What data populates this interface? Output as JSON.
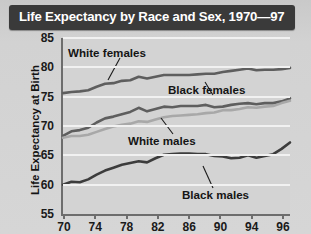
{
  "header": {
    "title": "Life Expectancy by Race and Sex, 1970—97"
  },
  "axes": {
    "y_title": "Life Expectancy at Birth",
    "y_ticks": [
      "85",
      "80",
      "75",
      "70",
      "65",
      "60",
      "55"
    ],
    "x_ticks": [
      "70",
      "74",
      "78",
      "82",
      "86",
      "90",
      "94",
      "96"
    ]
  },
  "annotations": {
    "white_females": "White females",
    "black_females": "Black females",
    "white_males": "White males",
    "black_males": "Black males"
  },
  "colors": {
    "header_bg": "#3a3a3a",
    "header_text": "#ffffff",
    "page_bg": "#d2d2d2",
    "plot_bg": "#d3d3d3",
    "gridline": "#f1f1f1",
    "axis": "#6d6d6d",
    "series_dark": "#5e5e5e",
    "series_light": "#a8a8a8",
    "series_black": "#3c3c3c"
  },
  "chart_data": {
    "type": "line",
    "title": "Life Expectancy by Race and Sex, 1970—97",
    "xlabel": "",
    "ylabel": "Life Expectancy at Birth",
    "xlim": [
      70,
      97
    ],
    "ylim": [
      55,
      85
    ],
    "grid": true,
    "legend_position": "inline-annotations",
    "x": [
      70,
      71,
      72,
      73,
      74,
      75,
      76,
      77,
      78,
      79,
      80,
      81,
      82,
      83,
      84,
      85,
      86,
      87,
      88,
      89,
      90,
      91,
      92,
      93,
      94,
      95,
      96,
      97
    ],
    "series": [
      {
        "name": "White females",
        "color": "#5e5e5e",
        "values": [
          75.6,
          75.8,
          75.9,
          76.1,
          76.7,
          77.2,
          77.3,
          77.7,
          77.8,
          78.4,
          78.1,
          78.4,
          78.7,
          78.7,
          78.7,
          78.7,
          78.8,
          78.9,
          78.9,
          79.2,
          79.4,
          79.6,
          79.8,
          79.5,
          79.6,
          79.6,
          79.7,
          79.9
        ]
      },
      {
        "name": "Black females",
        "color": "#5e5e5e",
        "values": [
          68.3,
          69.1,
          69.3,
          69.7,
          70.6,
          71.3,
          71.6,
          72.0,
          72.4,
          73.1,
          72.5,
          72.9,
          73.3,
          73.2,
          73.4,
          73.4,
          73.4,
          73.6,
          73.2,
          73.3,
          73.6,
          73.8,
          73.9,
          73.7,
          73.9,
          73.9,
          74.2,
          74.7
        ]
      },
      {
        "name": "White males",
        "color": "#a8a8a8",
        "values": [
          68.0,
          68.3,
          68.3,
          68.5,
          69.0,
          69.5,
          69.9,
          70.2,
          70.4,
          70.8,
          70.7,
          71.1,
          71.5,
          71.7,
          71.8,
          71.9,
          72.0,
          72.2,
          72.3,
          72.7,
          72.7,
          72.9,
          73.2,
          73.1,
          73.3,
          73.4,
          73.9,
          74.3
        ]
      },
      {
        "name": "Black males",
        "color": "#3c3c3c",
        "values": [
          60.0,
          60.5,
          60.4,
          60.9,
          61.7,
          62.4,
          62.9,
          63.4,
          63.7,
          64.0,
          63.8,
          64.5,
          65.1,
          65.2,
          65.3,
          65.3,
          65.2,
          65.2,
          64.9,
          64.8,
          64.5,
          64.6,
          65.0,
          64.6,
          64.9,
          65.2,
          66.1,
          67.2
        ]
      }
    ]
  }
}
